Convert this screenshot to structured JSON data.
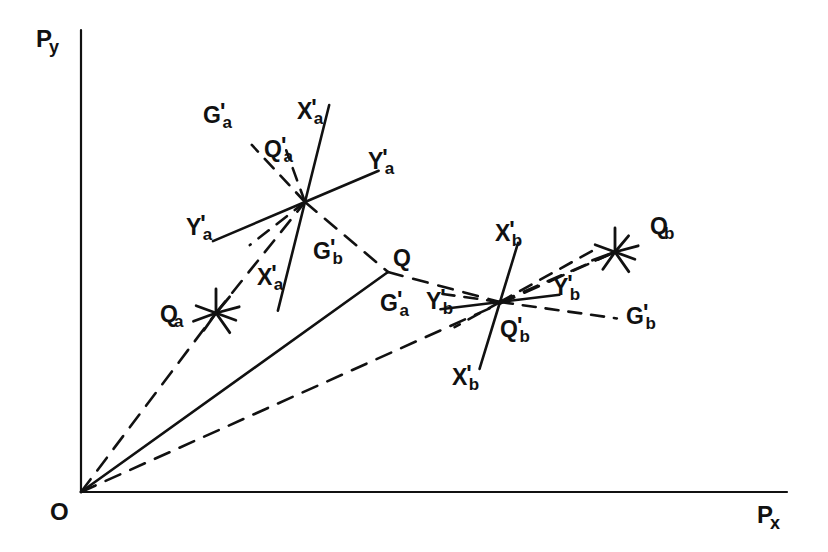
{
  "figure": {
    "type": "vector-diagram",
    "background": "#ffffff",
    "ink": "#111111",
    "width": 828,
    "height": 552
  },
  "axes": {
    "y_axis": {
      "label_base": "P",
      "label_sub": "y",
      "x": 81,
      "y_top": 30,
      "y_bottom": 492,
      "label_x": 36,
      "label_y": 27
    },
    "x_axis": {
      "label_base": "P",
      "label_sub": "x",
      "y": 492,
      "x_left": 81,
      "x_right": 787,
      "label_x": 757,
      "label_y": 503
    },
    "origin": {
      "label": "O",
      "x": 81,
      "y": 492,
      "label_x": 50,
      "label_y": 500
    }
  },
  "rays_from_origin": [
    {
      "name": "ray-to-Qa",
      "style": "dashed",
      "to_x": 216,
      "to_y": 313
    },
    {
      "name": "ray-to-Q",
      "style": "solid",
      "to_x": 388,
      "to_y": 272
    },
    {
      "name": "ray-to-Qb",
      "style": "dashed",
      "to_x": 615,
      "to_y": 252
    }
  ],
  "points": [
    {
      "name": "Qa",
      "marker": "asterisk",
      "x": 216,
      "y": 313,
      "label_base": "Q",
      "label_prime": "",
      "label_sub": "a",
      "label_x": 160,
      "label_y": 303
    },
    {
      "name": "Q",
      "marker": "vertex",
      "x": 388,
      "y": 272,
      "label_base": "Q",
      "label_prime": "",
      "label_sub": "",
      "label_x": 393,
      "label_y": 247
    },
    {
      "name": "Qb",
      "marker": "asterisk",
      "x": 615,
      "y": 252,
      "label_base": "Q",
      "label_prime": "",
      "label_sub": "b",
      "label_x": 650,
      "label_y": 215
    }
  ],
  "clusters": [
    {
      "name": "cluster-a",
      "center_x": 305,
      "center_y": 202,
      "axes": [
        {
          "id": "Xa",
          "base": "X",
          "prime": "'",
          "sub": "a",
          "style": "solid",
          "angle_deg": -76,
          "len_pos": 100,
          "len_neg": 112
        },
        {
          "id": "Ya",
          "base": "Y",
          "prime": "'",
          "sub": "a",
          "style": "solid",
          "angle_deg": -23,
          "len_pos": 80,
          "len_neg": 100
        },
        {
          "id": "Ga",
          "base": "G",
          "prime": "'",
          "sub": "a",
          "style": "dashed",
          "angle_deg": -133,
          "len_pos": 78,
          "len_neg": 0
        },
        {
          "id": "Qa_p",
          "base": "Q",
          "prime": "'",
          "sub": "a",
          "style": "dashed",
          "angle_deg": -110,
          "len_pos": 55,
          "len_neg": 0
        },
        {
          "id": "Gb_in",
          "base": "G",
          "prime": "'",
          "sub": "b",
          "style": "dashed",
          "angle_deg": -38,
          "len_pos": 0,
          "len_neg": 70
        }
      ],
      "labels": [
        {
          "base": "G",
          "prime": "'",
          "sub": "a",
          "x": 203,
          "y": 104
        },
        {
          "base": "X",
          "prime": "'",
          "sub": "a",
          "x": 297,
          "y": 100
        },
        {
          "base": "Q",
          "prime": "'",
          "sub": "a",
          "x": 264,
          "y": 138
        },
        {
          "base": "Y",
          "prime": "'",
          "sub": "a",
          "x": 368,
          "y": 150
        },
        {
          "base": "Y",
          "prime": "'",
          "sub": "a",
          "x": 186,
          "y": 216
        },
        {
          "base": "X",
          "prime": "'",
          "sub": "a",
          "x": 257,
          "y": 266
        },
        {
          "base": "G",
          "prime": "'",
          "sub": "b",
          "x": 313,
          "y": 240
        },
        {
          "base": "G",
          "prime": "'",
          "sub": "a",
          "x": 380,
          "y": 292
        }
      ]
    },
    {
      "name": "cluster-b",
      "center_x": 500,
      "center_y": 302,
      "axes": [
        {
          "id": "Xb",
          "base": "X",
          "prime": "'",
          "sub": "b",
          "style": "solid",
          "angle_deg": -73,
          "len_pos": 62,
          "len_neg": 70
        },
        {
          "id": "Yb",
          "base": "Y",
          "prime": "'",
          "sub": "b",
          "style": "solid",
          "angle_deg": -7,
          "len_pos": 60,
          "len_neg": 60
        },
        {
          "id": "Qb_p",
          "base": "Q",
          "prime": "'",
          "sub": "b",
          "style": "dashed",
          "angle_deg": -29,
          "len_pos": 105,
          "len_neg": 52
        },
        {
          "id": "Gb",
          "base": "G",
          "prime": "'",
          "sub": "b",
          "style": "dashed",
          "angle_deg": 8,
          "len_pos": 118,
          "len_neg": 58
        }
      ],
      "labels": [
        {
          "base": "X",
          "prime": "'",
          "sub": "b",
          "x": 495,
          "y": 222
        },
        {
          "base": "Y",
          "prime": "'",
          "sub": "b",
          "x": 426,
          "y": 290
        },
        {
          "base": "Q",
          "prime": "'",
          "sub": "b",
          "x": 500,
          "y": 318
        },
        {
          "base": "X",
          "prime": "'",
          "sub": "b",
          "x": 452,
          "y": 366
        },
        {
          "base": "Y",
          "prime": "'",
          "sub": "b",
          "x": 553,
          "y": 276
        },
        {
          "base": "G",
          "prime": "'",
          "sub": "b",
          "x": 626,
          "y": 305
        }
      ]
    }
  ],
  "connectors": [
    {
      "name": "Qa-to-clusterA",
      "style": "dashed",
      "from_x": 216,
      "from_y": 313,
      "to_x": 305,
      "to_y": 202
    },
    {
      "name": "clusterA-to-Q",
      "style": "dashed",
      "from_x": 305,
      "from_y": 202,
      "to_x": 388,
      "to_y": 272
    },
    {
      "name": "Q-to-clusterB",
      "style": "dashed",
      "from_x": 388,
      "from_y": 272,
      "to_x": 500,
      "to_y": 302
    },
    {
      "name": "clusterB-to-Qb",
      "style": "dashed",
      "from_x": 500,
      "from_y": 302,
      "to_x": 615,
      "to_y": 252
    }
  ]
}
